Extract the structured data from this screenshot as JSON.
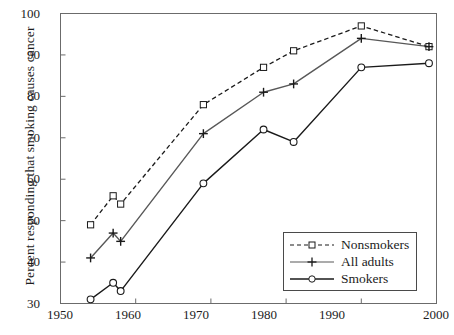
{
  "chart_data": {
    "type": "line",
    "title": "",
    "xlabel": "",
    "ylabel": "Percent responding that smoking causes cancer",
    "xlim": [
      1950,
      2000
    ],
    "ylim": [
      30,
      100
    ],
    "xticks": [
      1950,
      1960,
      1970,
      1980,
      1990,
      2000
    ],
    "xtick_labels": [
      "1950",
      "1960",
      "1970",
      "1980",
      "1990",
      "2000"
    ],
    "yticks": [
      30,
      40,
      50,
      60,
      70,
      80,
      90,
      100
    ],
    "ytick_labels": [
      "30",
      "40",
      "50",
      "60",
      "70",
      "80",
      "90",
      "100"
    ],
    "grid": false,
    "legend_position": "lower right",
    "series": [
      {
        "name": "Nonsmokers",
        "marker": "square",
        "linestyle": "dashed",
        "color": "#1a1a1a",
        "x": [
          1954,
          1957,
          1958,
          1969,
          1977,
          1981,
          1990,
          1999
        ],
        "values": [
          49,
          56,
          54,
          78,
          87,
          91,
          97,
          92
        ]
      },
      {
        "name": "All adults",
        "marker": "plus",
        "linestyle": "solid",
        "color": "#585858",
        "x": [
          1954,
          1957,
          1958,
          1969,
          1977,
          1981,
          1990,
          1999
        ],
        "values": [
          41,
          47,
          45,
          71,
          81,
          83,
          94,
          92
        ]
      },
      {
        "name": "Smokers",
        "marker": "circle",
        "linestyle": "solid",
        "color": "#1a1a1a",
        "x": [
          1954,
          1957,
          1958,
          1969,
          1977,
          1981,
          1990,
          1999
        ],
        "values": [
          31,
          35,
          33,
          59,
          72,
          69,
          87,
          88
        ]
      }
    ]
  },
  "legend": {
    "items": [
      {
        "label": "Nonsmokers"
      },
      {
        "label": "All adults"
      },
      {
        "label": "Smokers"
      }
    ]
  },
  "caption": ""
}
